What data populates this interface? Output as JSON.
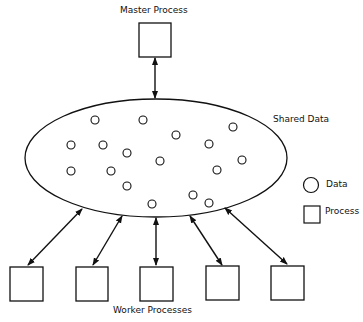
{
  "diagram": {
    "master": {
      "label": "Master Process",
      "box": {
        "x": 139,
        "y": 23,
        "w": 32,
        "h": 34
      }
    },
    "shared": {
      "label": "Shared Data",
      "ellipse": {
        "cx": 156,
        "cy": 158,
        "rx": 131,
        "ry": 59
      }
    },
    "data_points": [
      {
        "x": 95,
        "y": 120
      },
      {
        "x": 143,
        "y": 120
      },
      {
        "x": 233,
        "y": 127
      },
      {
        "x": 176,
        "y": 135
      },
      {
        "x": 209,
        "y": 144
      },
      {
        "x": 71,
        "y": 145
      },
      {
        "x": 103,
        "y": 145
      },
      {
        "x": 127,
        "y": 153
      },
      {
        "x": 242,
        "y": 160
      },
      {
        "x": 160,
        "y": 161
      },
      {
        "x": 217,
        "y": 170
      },
      {
        "x": 71,
        "y": 171
      },
      {
        "x": 111,
        "y": 171
      },
      {
        "x": 127,
        "y": 186
      },
      {
        "x": 193,
        "y": 195
      },
      {
        "x": 209,
        "y": 203
      },
      {
        "x": 152,
        "y": 204
      }
    ],
    "workers": {
      "label": "Worker Processes",
      "boxes": [
        {
          "x": 10,
          "y": 267,
          "w": 33,
          "h": 34
        },
        {
          "x": 76,
          "y": 267,
          "w": 32,
          "h": 34
        },
        {
          "x": 140,
          "y": 267,
          "w": 33,
          "h": 34
        },
        {
          "x": 206,
          "y": 266,
          "w": 33,
          "h": 34
        },
        {
          "x": 271,
          "y": 266,
          "w": 33,
          "h": 34
        }
      ]
    },
    "arrows": [
      {
        "x1": 155,
        "y1": 58,
        "x2": 155,
        "y2": 98
      },
      {
        "x1": 28,
        "y1": 265,
        "x2": 82,
        "y2": 209
      },
      {
        "x1": 93,
        "y1": 265,
        "x2": 122,
        "y2": 216
      },
      {
        "x1": 156,
        "y1": 265,
        "x2": 156,
        "y2": 218
      },
      {
        "x1": 222,
        "y1": 265,
        "x2": 190,
        "y2": 216
      },
      {
        "x1": 287,
        "y1": 264,
        "x2": 225,
        "y2": 208
      }
    ],
    "legend": {
      "data_label": "Data",
      "process_label": "Process",
      "circle": {
        "cx": 311,
        "cy": 185,
        "r": 7.5
      },
      "square": {
        "x": 304,
        "y": 206,
        "w": 16,
        "h": 17
      }
    },
    "colors": {
      "stroke": "#111111",
      "background": "#ffffff"
    }
  }
}
